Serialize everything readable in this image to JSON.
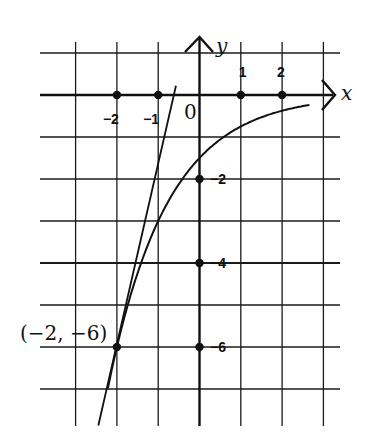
{
  "chart_data": {
    "type": "line",
    "title": "",
    "xlabel": "x",
    "ylabel": "y",
    "origin_label": "0",
    "grid": true,
    "xlim": [
      -3,
      3
    ],
    "ylim": [
      -7.5,
      1.4
    ],
    "x_ticks": [
      {
        "value": -2,
        "label": "−2"
      },
      {
        "value": -1,
        "label": "−1"
      },
      {
        "value": 1,
        "label": "1"
      },
      {
        "value": 2,
        "label": "2"
      }
    ],
    "y_ticks": [
      {
        "value": -2,
        "label": "−2"
      },
      {
        "value": -4,
        "label": "−4"
      },
      {
        "value": -6,
        "label": "−6"
      }
    ],
    "series": [
      {
        "name": "curve",
        "formula": "y = -1.5 * 2^(-x)",
        "x": [
          -2.2,
          -2,
          -1.5,
          -1,
          -0.5,
          0,
          0.5,
          1,
          1.5,
          2,
          2.7
        ],
        "y": [
          -6.89,
          -6.0,
          -4.24,
          -3.0,
          -2.12,
          -1.5,
          -1.06,
          -0.75,
          -0.53,
          -0.375,
          -0.23
        ]
      },
      {
        "name": "tangent-line",
        "formula": "y = -6 + 4.16(x + 2)",
        "x": [
          -2.45,
          -0.57
        ],
        "y": [
          -7.87,
          0.22
        ]
      }
    ],
    "annotations": [
      {
        "text": "(−2, −6)",
        "x": -2,
        "y": -6
      }
    ],
    "marked_points": [
      {
        "x": -2,
        "y": 0
      },
      {
        "x": -1,
        "y": 0
      },
      {
        "x": 1,
        "y": 0
      },
      {
        "x": 2,
        "y": 0
      },
      {
        "x": 0,
        "y": -2
      },
      {
        "x": 0,
        "y": -4
      },
      {
        "x": 0,
        "y": -6
      },
      {
        "x": -2,
        "y": -6
      }
    ]
  }
}
